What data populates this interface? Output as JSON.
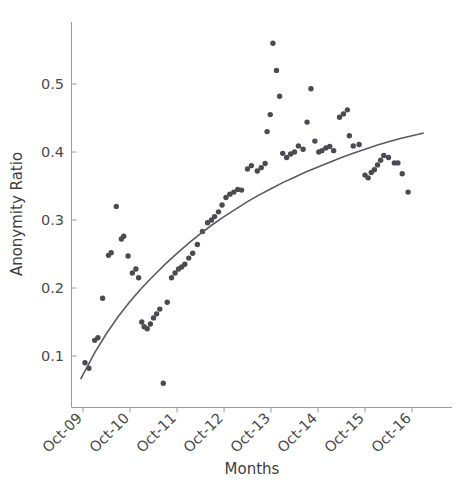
{
  "chart_data": {
    "type": "scatter",
    "title": "",
    "xlabel": "Months",
    "ylabel": "Anonymity Ratio",
    "x_tick_labels": [
      "Oct-09",
      "Oct-10",
      "Oct-11",
      "Oct-12",
      "Oct-13",
      "Oct-14",
      "Oct-15",
      "Oct-16"
    ],
    "x_tick_values": [
      0,
      12,
      24,
      36,
      48,
      60,
      72,
      84
    ],
    "y_tick_labels": [
      "0.1",
      "0.2",
      "0.3",
      "0.4",
      "0.5"
    ],
    "y_tick_values": [
      0.1,
      0.2,
      0.3,
      0.4,
      0.5
    ],
    "xlim": [
      -3,
      91
    ],
    "ylim": [
      0.04,
      0.585
    ],
    "grid": false,
    "legend": false,
    "x_unit": "months since Oct-2009",
    "series": [
      {
        "name": "Anonymity Ratio",
        "marker": "circle",
        "color": "#4a4a52",
        "points": [
          [
            0.5,
            0.09
          ],
          [
            1.5,
            0.082
          ],
          [
            3.0,
            0.123
          ],
          [
            3.8,
            0.127
          ],
          [
            5.0,
            0.185
          ],
          [
            6.5,
            0.248
          ],
          [
            7.2,
            0.252
          ],
          [
            8.5,
            0.32
          ],
          [
            9.8,
            0.272
          ],
          [
            10.4,
            0.276
          ],
          [
            11.5,
            0.247
          ],
          [
            12.6,
            0.222
          ],
          [
            13.5,
            0.228
          ],
          [
            14.2,
            0.215
          ],
          [
            15.0,
            0.15
          ],
          [
            15.6,
            0.143
          ],
          [
            16.4,
            0.14
          ],
          [
            17.2,
            0.147
          ],
          [
            18.0,
            0.156
          ],
          [
            18.8,
            0.162
          ],
          [
            19.6,
            0.169
          ],
          [
            20.5,
            0.06
          ],
          [
            21.5,
            0.179
          ],
          [
            22.6,
            0.215
          ],
          [
            23.5,
            0.222
          ],
          [
            24.4,
            0.228
          ],
          [
            25.2,
            0.231
          ],
          [
            26.0,
            0.235
          ],
          [
            27.0,
            0.244
          ],
          [
            28.0,
            0.251
          ],
          [
            29.2,
            0.264
          ],
          [
            30.5,
            0.283
          ],
          [
            31.8,
            0.296
          ],
          [
            32.8,
            0.3
          ],
          [
            33.6,
            0.305
          ],
          [
            34.6,
            0.312
          ],
          [
            35.5,
            0.322
          ],
          [
            36.5,
            0.333
          ],
          [
            37.5,
            0.338
          ],
          [
            38.5,
            0.341
          ],
          [
            39.5,
            0.345
          ],
          [
            40.5,
            0.344
          ],
          [
            42.0,
            0.375
          ],
          [
            43.0,
            0.38
          ],
          [
            44.5,
            0.372
          ],
          [
            45.5,
            0.377
          ],
          [
            46.5,
            0.383
          ],
          [
            47.0,
            0.43
          ],
          [
            47.8,
            0.455
          ],
          [
            48.5,
            0.56
          ],
          [
            49.4,
            0.52
          ],
          [
            50.2,
            0.482
          ],
          [
            51.0,
            0.398
          ],
          [
            52.0,
            0.392
          ],
          [
            53.0,
            0.397
          ],
          [
            54.0,
            0.4
          ],
          [
            55.0,
            0.409
          ],
          [
            56.2,
            0.404
          ],
          [
            57.2,
            0.444
          ],
          [
            58.2,
            0.493
          ],
          [
            59.2,
            0.416
          ],
          [
            60.2,
            0.4
          ],
          [
            61.0,
            0.402
          ],
          [
            62.0,
            0.406
          ],
          [
            63.0,
            0.408
          ],
          [
            64.0,
            0.402
          ],
          [
            65.5,
            0.451
          ],
          [
            66.5,
            0.456
          ],
          [
            67.5,
            0.462
          ],
          [
            68.0,
            0.424
          ],
          [
            69.0,
            0.409
          ],
          [
            70.5,
            0.411
          ],
          [
            72.0,
            0.366
          ],
          [
            72.8,
            0.362
          ],
          [
            73.6,
            0.37
          ],
          [
            74.4,
            0.374
          ],
          [
            75.2,
            0.381
          ],
          [
            76.0,
            0.388
          ],
          [
            76.8,
            0.395
          ],
          [
            78.0,
            0.392
          ],
          [
            79.5,
            0.384
          ],
          [
            80.4,
            0.384
          ],
          [
            81.5,
            0.368
          ],
          [
            83.0,
            0.341
          ]
        ]
      }
    ],
    "trendline": {
      "name": "fitted curve",
      "type": "logarithmic",
      "color": "#5a5a62",
      "points": [
        [
          -0.6,
          0.066
        ],
        [
          3.0,
          0.105
        ],
        [
          6.0,
          0.133
        ],
        [
          9.0,
          0.158
        ],
        [
          12.0,
          0.18
        ],
        [
          15.0,
          0.2
        ],
        [
          18.0,
          0.218
        ],
        [
          21.0,
          0.235
        ],
        [
          24.0,
          0.251
        ],
        [
          27.0,
          0.266
        ],
        [
          30.0,
          0.28
        ],
        [
          33.0,
          0.293
        ],
        [
          36.0,
          0.305
        ],
        [
          39.0,
          0.316
        ],
        [
          42.0,
          0.327
        ],
        [
          45.0,
          0.337
        ],
        [
          48.0,
          0.346
        ],
        [
          51.0,
          0.355
        ],
        [
          54.0,
          0.363
        ],
        [
          57.0,
          0.371
        ],
        [
          60.0,
          0.378
        ],
        [
          63.0,
          0.385
        ],
        [
          66.0,
          0.392
        ],
        [
          69.0,
          0.398
        ],
        [
          72.0,
          0.404
        ],
        [
          75.0,
          0.41
        ],
        [
          78.0,
          0.415
        ],
        [
          81.0,
          0.42
        ],
        [
          84.0,
          0.424
        ],
        [
          87.0,
          0.428
        ]
      ]
    }
  }
}
